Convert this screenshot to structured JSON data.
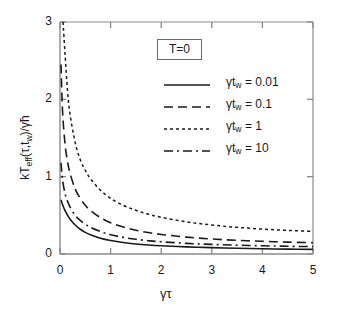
{
  "chart_data": {
    "type": "line",
    "title": "",
    "xlabel": "γτ",
    "ylabel": "kT_eff(τ,t_w)/γħ",
    "xlim": [
      0,
      5
    ],
    "ylim": [
      0,
      3
    ],
    "xticks": [
      "0",
      "1",
      "2",
      "3",
      "4",
      "5"
    ],
    "yticks": [
      "0",
      "1",
      "2",
      "3"
    ],
    "grid": false,
    "legend_position": "upper-right-inside",
    "annotations": [
      {
        "name": "temperature",
        "text": "T=0"
      }
    ],
    "series": [
      {
        "name": "γt_w = 0.01",
        "style": "solid",
        "x": [
          0.02,
          0.05,
          0.1,
          0.15,
          0.2,
          0.3,
          0.4,
          0.5,
          0.6,
          0.8,
          1.0,
          1.25,
          1.5,
          1.75,
          2.0,
          2.5,
          3.0,
          3.5,
          4.0,
          4.5,
          5.0
        ],
        "y": [
          0.7,
          0.64,
          0.56,
          0.5,
          0.45,
          0.375,
          0.32,
          0.28,
          0.25,
          0.205,
          0.175,
          0.148,
          0.13,
          0.117,
          0.107,
          0.092,
          0.082,
          0.074,
          0.068,
          0.063,
          0.06
        ]
      },
      {
        "name": "γt_w = 0.1",
        "style": "dashed",
        "x": [
          0.02,
          0.05,
          0.1,
          0.15,
          0.2,
          0.3,
          0.4,
          0.5,
          0.6,
          0.8,
          1.0,
          1.25,
          1.5,
          1.75,
          2.0,
          2.5,
          3.0,
          3.5,
          4.0,
          4.5,
          5.0
        ],
        "y": [
          2.45,
          1.85,
          1.42,
          1.19,
          1.04,
          0.84,
          0.72,
          0.63,
          0.565,
          0.47,
          0.405,
          0.35,
          0.308,
          0.277,
          0.253,
          0.218,
          0.194,
          0.177,
          0.164,
          0.154,
          0.146
        ]
      },
      {
        "name": "γt_w = 1",
        "style": "dotted",
        "x": [
          0.06,
          0.1,
          0.15,
          0.2,
          0.3,
          0.4,
          0.5,
          0.6,
          0.8,
          1.0,
          1.25,
          1.5,
          1.75,
          2.0,
          2.5,
          3.0,
          3.5,
          4.0,
          4.5,
          5.0
        ],
        "y": [
          3.0,
          2.58,
          2.1,
          1.8,
          1.44,
          1.22,
          1.08,
          0.975,
          0.825,
          0.72,
          0.63,
          0.565,
          0.515,
          0.475,
          0.415,
          0.375,
          0.345,
          0.322,
          0.305,
          0.292
        ]
      },
      {
        "name": "γt_w = 10",
        "style": "dashdot",
        "x": [
          0.02,
          0.05,
          0.1,
          0.15,
          0.2,
          0.3,
          0.4,
          0.5,
          0.6,
          0.8,
          1.0,
          1.25,
          1.5,
          1.75,
          2.0,
          2.5,
          3.0,
          3.5,
          4.0,
          4.5,
          5.0
        ],
        "y": [
          1.18,
          0.96,
          0.78,
          0.68,
          0.605,
          0.5,
          0.435,
          0.385,
          0.345,
          0.29,
          0.25,
          0.215,
          0.19,
          0.172,
          0.158,
          0.138,
          0.124,
          0.114,
          0.106,
          0.1,
          0.095
        ]
      }
    ]
  },
  "axes": {
    "x_title": "γτ",
    "y_title_prefix": "kT",
    "y_title_sub": "eff",
    "y_title_mid": "(τ,t",
    "y_title_sub2": "w",
    "y_title_suffix": ")/γħ",
    "x_tick_labels": [
      "0",
      "1",
      "2",
      "3",
      "4",
      "5"
    ],
    "y_tick_labels": [
      "0",
      "1",
      "2",
      "3"
    ]
  },
  "annotation_box": {
    "label": "T=0"
  },
  "legend": {
    "entries": [
      {
        "prefix": "γt",
        "sub": "w",
        "value": " = 0.01",
        "style": "solid"
      },
      {
        "prefix": "γt",
        "sub": "w",
        "value": " = 0.1",
        "style": "dashed"
      },
      {
        "prefix": "γt",
        "sub": "w",
        "value": " = 1",
        "style": "dotted"
      },
      {
        "prefix": "γt",
        "sub": "w",
        "value": " = 10",
        "style": "dashdot"
      }
    ]
  },
  "colors": {
    "axis": "#8a8a8a",
    "curve": "#1a1a1a",
    "text": "#1a1a1a",
    "background": "#ffffff",
    "box_border": "#6b6b6b"
  }
}
